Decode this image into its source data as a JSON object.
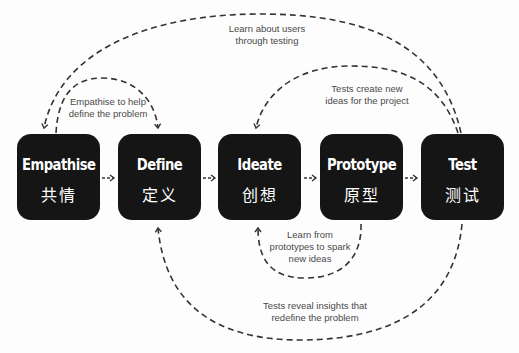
{
  "diagram": {
    "type": "design-thinking-process",
    "stages": [
      {
        "id": "empathise",
        "label_en": "Empathise",
        "label_zh": "共情"
      },
      {
        "id": "define",
        "label_en": "Define",
        "label_zh": "定义"
      },
      {
        "id": "ideate",
        "label_en": "Ideate",
        "label_zh": "创想"
      },
      {
        "id": "prototype",
        "label_en": "Prototype",
        "label_zh": "原型"
      },
      {
        "id": "test",
        "label_en": "Test",
        "label_zh": "测试"
      }
    ],
    "forward_arrows": [
      {
        "from": "empathise",
        "to": "define"
      },
      {
        "from": "define",
        "to": "ideate"
      },
      {
        "from": "ideate",
        "to": "prototype"
      },
      {
        "from": "prototype",
        "to": "test"
      }
    ],
    "feedback_loops": [
      {
        "from": "test",
        "to": "empathise",
        "label_line1": "Learn about users",
        "label_line2": "through testing"
      },
      {
        "from": "empathise",
        "to": "define",
        "label_line1": "Empathise to help",
        "label_line2": "define the problem"
      },
      {
        "from": "test",
        "to": "ideate",
        "label_line1": "Tests create new",
        "label_line2": "ideas for the project"
      },
      {
        "from": "prototype",
        "to": "ideate",
        "label_line1": "Learn from",
        "label_line2": "prototypes to spark",
        "label_line3": "new ideas"
      },
      {
        "from": "test",
        "to": "define",
        "label_line1": "Tests reveal insights that",
        "label_line2": "redefine the problem"
      }
    ],
    "colors": {
      "box": "#151515",
      "box_text": "#ffffff",
      "line": "#333333",
      "note_text": "#4a4a4a",
      "background": "#fdfdfd"
    }
  }
}
